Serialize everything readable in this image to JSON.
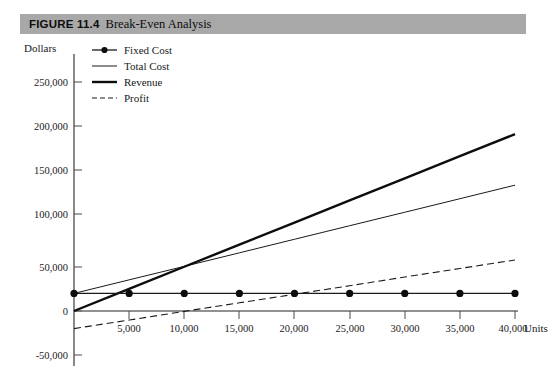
{
  "figure": {
    "label": "FIGURE 11.4",
    "title": "Break-Even Analysis"
  },
  "chart_data": {
    "type": "line",
    "title": "Break-Even Analysis",
    "xlabel": "Units",
    "ylabel": "Dollars",
    "x": [
      0,
      5000,
      10000,
      15000,
      20000,
      25000,
      30000,
      35000,
      40000
    ],
    "xtick_labels": [
      "",
      "5,000",
      "10,000",
      "15,000",
      "20,000",
      "25,000",
      "30,000",
      "35,000",
      "40,000"
    ],
    "xlim": [
      0,
      40000
    ],
    "ytick_labels": [
      "250,000",
      "200,000",
      "150,000",
      "100,000",
      "50,000",
      "0",
      "-50,000"
    ],
    "ytick_values": [
      250000,
      200000,
      150000,
      100000,
      50000,
      0,
      -50000
    ],
    "ylim": [
      -50000,
      250000
    ],
    "grid": false,
    "legend_position": "top-left",
    "series": [
      {
        "name": "Fixed Cost",
        "style": "solid-marker",
        "color": "#1a1a1a",
        "width": 1.2,
        "marker": "circle",
        "values": [
          20000,
          20000,
          20000,
          20000,
          20000,
          20000,
          20000,
          20000,
          20000
        ]
      },
      {
        "name": "Total Cost",
        "style": "thin",
        "color": "#1a1a1a",
        "width": 1.0,
        "marker": "none",
        "values": [
          20000,
          35400,
          50700,
          66100,
          81500,
          96900,
          112200,
          127600,
          143000
        ]
      },
      {
        "name": "Revenue",
        "style": "thick",
        "color": "#0d0d0d",
        "width": 2.4,
        "marker": "none",
        "values": [
          0,
          25100,
          50300,
          75400,
          100500,
          125600,
          150800,
          175900,
          201000
        ]
      },
      {
        "name": "Profit",
        "style": "dashed",
        "color": "#1a1a1a",
        "width": 1.1,
        "marker": "none",
        "values": [
          -20000,
          -10300,
          -400,
          9300,
          19000,
          28700,
          38600,
          48300,
          58000
        ]
      }
    ],
    "break_even_units": 10500,
    "annotations": []
  }
}
